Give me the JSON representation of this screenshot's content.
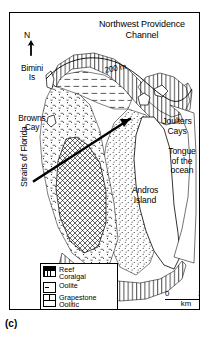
{
  "figure": {
    "panel_label": "(c)"
  },
  "map": {
    "north_indicator": "N",
    "labels": {
      "nw_channel": "Northwest Providence\nChannel",
      "bimini": "Bimini\nIs",
      "browns_cay": "Browns\nCay",
      "straits_of_florida": "Straits of Florida",
      "joulters_cays": "Joulters\nCays",
      "tongue_of_the_ocean": "Tongue\nof the\nocean",
      "andros_island": "Andros\nIsland",
      "depth_contour": "200 m"
    }
  },
  "legend": {
    "items": [
      {
        "swatch": "reef-coralgal-swatch",
        "text": "Reef\nCoralgal"
      },
      {
        "swatch": "oolite-swatch",
        "text": "Oolite"
      },
      {
        "swatch": "grapestone-oolitic-swatch",
        "text": "Grapestone\nOolitic"
      },
      {
        "swatch": "pellet-mud-mud-swatch",
        "text": "Pellet mud\nMud"
      }
    ]
  },
  "scale_bar": {
    "start": "0",
    "end": "20",
    "unit": "km"
  },
  "colors": {
    "ink": "#000000",
    "paper": "#ffffff"
  }
}
